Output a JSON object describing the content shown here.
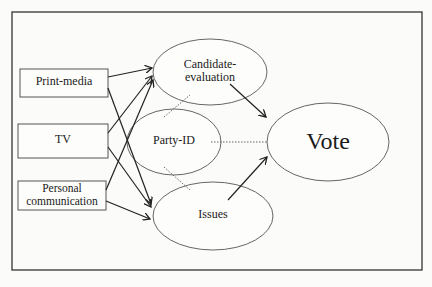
{
  "diagram": {
    "sources": [
      {
        "id": "print",
        "label": "Print-media"
      },
      {
        "id": "tv",
        "label": "TV"
      },
      {
        "id": "personal",
        "label_line1": "Personal",
        "label_line2": "communication"
      }
    ],
    "mediators": [
      {
        "id": "candidate",
        "label_line1": "Candidate-",
        "label_line2": "evaluation"
      },
      {
        "id": "party",
        "label": "Party-ID"
      },
      {
        "id": "issues",
        "label": "Issues"
      }
    ],
    "outcome": {
      "id": "vote",
      "label": "Vote"
    },
    "edges": [
      {
        "from": "print",
        "to": "candidate",
        "style": "arrow"
      },
      {
        "from": "print",
        "to": "issues",
        "style": "arrow"
      },
      {
        "from": "tv",
        "to": "candidate",
        "style": "arrow"
      },
      {
        "from": "tv",
        "to": "issues",
        "style": "arrow"
      },
      {
        "from": "personal",
        "to": "candidate",
        "style": "arrow"
      },
      {
        "from": "personal",
        "to": "issues",
        "style": "arrow"
      },
      {
        "from": "candidate",
        "to": "vote",
        "style": "arrow"
      },
      {
        "from": "issues",
        "to": "vote",
        "style": "arrow"
      },
      {
        "from": "party",
        "to": "vote",
        "style": "dotted"
      },
      {
        "from": "party",
        "to": "candidate",
        "style": "dotted"
      },
      {
        "from": "party",
        "to": "issues",
        "style": "dotted"
      }
    ]
  }
}
